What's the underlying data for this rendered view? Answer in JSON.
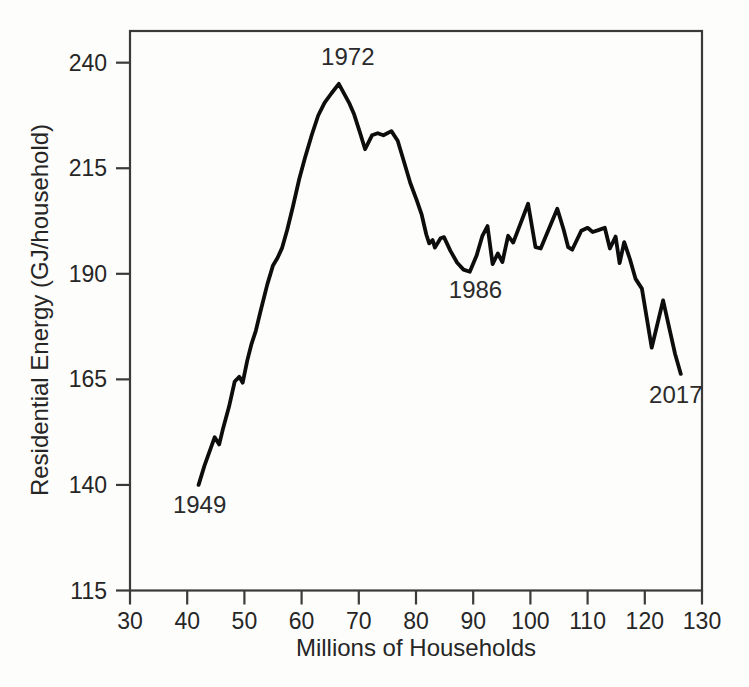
{
  "figure": {
    "background": "#fdfdfb",
    "line_color": "#0d0d0d",
    "axis_color": "#3a3a3a",
    "text_color": "#262626"
  },
  "chart_data": {
    "type": "line",
    "title": "",
    "xlabel": "Millions of Households",
    "ylabel": "Residential Energy (GJ/household)",
    "xlim": [
      30,
      130
    ],
    "ylim": [
      115,
      247.5
    ],
    "xticks": [
      30,
      40,
      50,
      60,
      70,
      80,
      90,
      100,
      110,
      120,
      130
    ],
    "yticks": [
      115,
      140,
      165,
      190,
      215,
      240
    ],
    "grid": false,
    "legend": "none",
    "series": [
      {
        "name": "US residential energy use per household, 1949-2017",
        "points": [
          [
            42.0,
            140.0
          ],
          [
            43.0,
            144.5
          ],
          [
            44.8,
            151.3
          ],
          [
            45.6,
            149.6
          ],
          [
            46.3,
            153.5
          ],
          [
            47.3,
            158.5
          ],
          [
            48.3,
            164.5
          ],
          [
            49.1,
            165.6
          ],
          [
            49.7,
            164.2
          ],
          [
            50.5,
            169.5
          ],
          [
            51.2,
            173.2
          ],
          [
            52.0,
            176.5
          ],
          [
            52.8,
            181.0
          ],
          [
            54.0,
            187.5
          ],
          [
            55.0,
            192.0
          ],
          [
            55.8,
            193.8
          ],
          [
            56.6,
            196.2
          ],
          [
            57.5,
            200.5
          ],
          [
            58.5,
            206.0
          ],
          [
            59.6,
            212.5
          ],
          [
            60.6,
            217.5
          ],
          [
            61.8,
            223.0
          ],
          [
            62.9,
            227.5
          ],
          [
            64.0,
            230.5
          ],
          [
            65.2,
            232.7
          ],
          [
            66.5,
            235.0
          ],
          [
            67.5,
            232.5
          ],
          [
            68.3,
            230.5
          ],
          [
            69.2,
            227.7
          ],
          [
            70.2,
            223.5
          ],
          [
            71.1,
            219.5
          ],
          [
            72.3,
            222.8
          ],
          [
            73.3,
            223.3
          ],
          [
            74.3,
            222.8
          ],
          [
            75.7,
            223.8
          ],
          [
            76.8,
            221.5
          ],
          [
            77.8,
            217.0
          ],
          [
            79.0,
            211.5
          ],
          [
            80.1,
            207.5
          ],
          [
            81.0,
            204.0
          ],
          [
            81.8,
            199.3
          ],
          [
            82.3,
            197.2
          ],
          [
            82.9,
            198.0
          ],
          [
            83.3,
            196.2
          ],
          [
            84.3,
            198.4
          ],
          [
            84.9,
            198.7
          ],
          [
            86.0,
            195.5
          ],
          [
            87.2,
            192.6
          ],
          [
            88.3,
            191.0
          ],
          [
            89.4,
            190.5
          ],
          [
            90.6,
            194.3
          ],
          [
            91.6,
            199.0
          ],
          [
            92.5,
            201.3
          ],
          [
            93.4,
            192.3
          ],
          [
            94.3,
            194.8
          ],
          [
            95.1,
            192.8
          ],
          [
            96.1,
            199.0
          ],
          [
            97.0,
            197.4
          ],
          [
            99.6,
            206.6
          ],
          [
            100.9,
            196.3
          ],
          [
            101.8,
            196.0
          ],
          [
            104.7,
            205.4
          ],
          [
            105.8,
            200.5
          ],
          [
            106.6,
            196.3
          ],
          [
            107.3,
            195.7
          ],
          [
            108.9,
            200.2
          ],
          [
            110.0,
            200.9
          ],
          [
            110.9,
            199.9
          ],
          [
            112.0,
            200.4
          ],
          [
            113.0,
            200.9
          ],
          [
            113.9,
            196.0
          ],
          [
            114.9,
            198.8
          ],
          [
            115.6,
            192.5
          ],
          [
            116.4,
            197.5
          ],
          [
            117.4,
            193.5
          ],
          [
            118.4,
            188.8
          ],
          [
            119.5,
            186.5
          ],
          [
            121.2,
            172.5
          ],
          [
            123.2,
            183.7
          ],
          [
            124.3,
            177.0
          ],
          [
            125.3,
            171.0
          ],
          [
            126.3,
            166.3
          ]
        ]
      }
    ],
    "annotations": [
      {
        "label": "1949",
        "x": 42.0,
        "y": 140.0,
        "dx": 1,
        "dy": 20
      },
      {
        "label": "1972",
        "x": 66.5,
        "y": 235.0,
        "dx": 9,
        "dy": -27
      },
      {
        "label": "1986",
        "x": 88.3,
        "y": 191.0,
        "dx": 12,
        "dy": 20
      },
      {
        "label": "2017",
        "x": 126.3,
        "y": 166.3,
        "dx": -5,
        "dy": 21
      }
    ]
  }
}
